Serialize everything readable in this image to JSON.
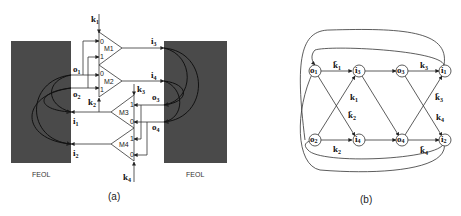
{
  "figure_a": {
    "caption": "(a)",
    "feol_left": "FEOL",
    "feol_right": "FEOL",
    "muxes": [
      {
        "name": "M1",
        "key": "k",
        "key_sub": "1",
        "in0": "0",
        "in1": "1"
      },
      {
        "name": "M2",
        "key": "k",
        "key_sub": "2",
        "in0": "0",
        "in1": "1"
      },
      {
        "name": "M3",
        "key": "k",
        "key_sub": "3",
        "in0": "0",
        "in1": "1"
      },
      {
        "name": "M4",
        "key": "k",
        "key_sub": "4",
        "in0": "0",
        "in1": "1"
      }
    ],
    "left_pins": [
      {
        "label": "o",
        "sub": "1"
      },
      {
        "label": "o",
        "sub": "2"
      },
      {
        "label": "i",
        "sub": "1"
      },
      {
        "label": "i",
        "sub": "2"
      }
    ],
    "right_pins": [
      {
        "label": "i",
        "sub": "3"
      },
      {
        "label": "i",
        "sub": "4"
      },
      {
        "label": "o",
        "sub": "3"
      },
      {
        "label": "o",
        "sub": "4"
      }
    ]
  },
  "figure_b": {
    "caption": "(b)",
    "nodes_top": [
      {
        "label": "o",
        "sub": "1"
      },
      {
        "label": "i",
        "sub": "3"
      },
      {
        "label": "o",
        "sub": "3"
      },
      {
        "label": "i",
        "sub": "1"
      }
    ],
    "nodes_bottom": [
      {
        "label": "o",
        "sub": "2"
      },
      {
        "label": "i",
        "sub": "4"
      },
      {
        "label": "o",
        "sub": "4"
      },
      {
        "label": "i",
        "sub": "2"
      }
    ],
    "edge_labels": [
      {
        "label": "k̄",
        "sub": "1"
      },
      {
        "label": "k",
        "sub": "1"
      },
      {
        "label": "k̄",
        "sub": "2"
      },
      {
        "label": "k",
        "sub": "2"
      },
      {
        "label": "k",
        "sub": "3"
      },
      {
        "label": "k̄",
        "sub": "3"
      },
      {
        "label": "k",
        "sub": "4"
      },
      {
        "label": "k̄",
        "sub": "4"
      }
    ]
  }
}
